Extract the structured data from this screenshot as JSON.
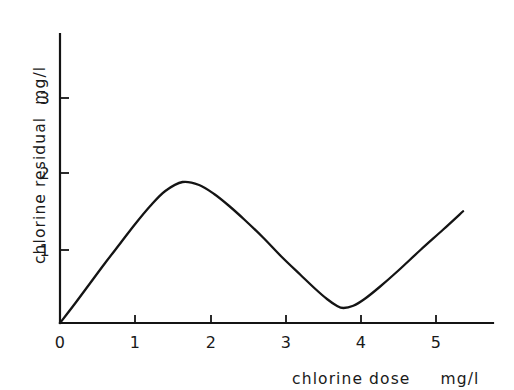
{
  "chart_data": {
    "type": "line",
    "title": "",
    "subtitle": "",
    "xlabel": "chlorine dose",
    "xlabel_units": "mg/l",
    "ylabel": "chlorine residual",
    "ylabel_units": "mg/l",
    "xlim": [
      0,
      5.8
    ],
    "ylim": [
      0,
      3.6
    ],
    "x_ticks": [
      0,
      1,
      2,
      3,
      4,
      5
    ],
    "x_tick_labels": [
      "0",
      "1",
      "2",
      "3",
      "4",
      "5"
    ],
    "y_ticks": [
      1,
      2,
      3
    ],
    "y_tick_labels": [
      "1",
      "2",
      "3"
    ],
    "origin_label": "0",
    "grid": false,
    "legend": false,
    "legend_position": "none",
    "line_color": "#141414",
    "axis_color": "#141414",
    "background_color": "#ffffff",
    "annotations": [],
    "series": [
      {
        "name": "breakpoint chlorination curve",
        "x": [
          0.0,
          0.2,
          0.4,
          0.6,
          0.8,
          1.0,
          1.2,
          1.4,
          1.63,
          1.85,
          2.05,
          2.25,
          2.45,
          2.7,
          2.95,
          3.2,
          3.4,
          3.55,
          3.68,
          3.77,
          3.9,
          4.05,
          4.25,
          4.5,
          4.8,
          5.1,
          5.36
        ],
        "y": [
          0.0,
          0.26,
          0.53,
          0.8,
          1.06,
          1.32,
          1.56,
          1.76,
          1.88,
          1.84,
          1.72,
          1.56,
          1.38,
          1.14,
          0.88,
          0.64,
          0.45,
          0.32,
          0.23,
          0.2,
          0.23,
          0.32,
          0.48,
          0.7,
          0.98,
          1.25,
          1.49
        ]
      }
    ]
  },
  "axes": {
    "x_axis_name": "chlorine dose axis",
    "y_axis_name": "chlorine residual axis"
  }
}
